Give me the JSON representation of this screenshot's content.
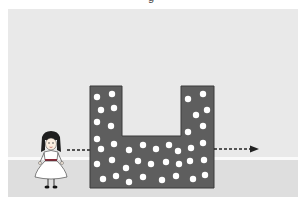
{
  "caption_fragment": "g",
  "scene": {
    "description": "Girl standing left of a U-shaped dotted block with a dashed arrow passing through toward the right",
    "colors": {
      "sky": "#e9e9e9",
      "ground": "#dedede",
      "ground_line": "#fafafa",
      "block": "#5e5e5e",
      "block_outline": "#3a3a3a",
      "dots": "#ffffff",
      "arrow": "#222222"
    },
    "icons": [
      "girl-figure",
      "u-shaped-block",
      "dashed-arrow"
    ]
  }
}
